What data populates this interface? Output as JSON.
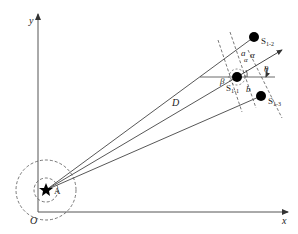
{
  "diagram": {
    "axes": {
      "origin_label": "O",
      "x_label": "x",
      "y_label": "y"
    },
    "source": {
      "name": "A",
      "symbol": "star"
    },
    "sensors": [
      {
        "id": "S1-1",
        "base": "S",
        "sub": "1-1"
      },
      {
        "id": "S1-2",
        "base": "S",
        "sub": "1-2"
      },
      {
        "id": "S1-3",
        "base": "S",
        "sub": "1-3"
      }
    ],
    "labels": {
      "distance": "D",
      "angle_alpha_1": "α",
      "angle_alpha_2": "α",
      "angle_beta": "β",
      "angle_theta": "θ",
      "angle_phi": "γ",
      "spacing_a": "a",
      "spacing_b": "b"
    },
    "colors": {
      "line": "#444444",
      "node": "#000000",
      "background": "#ffffff"
    }
  }
}
